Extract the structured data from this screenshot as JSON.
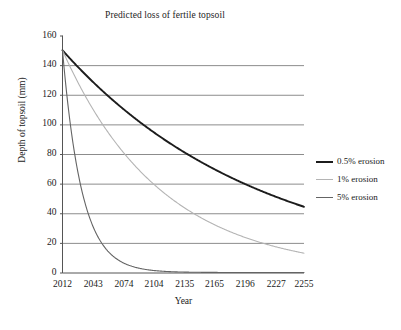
{
  "chart_data": {
    "type": "line",
    "title": "Predicted loss of fertile topsoil",
    "xlabel": "Year",
    "ylabel": "Depth of topsoil (mm)",
    "xlim": [
      2012,
      2255
    ],
    "ylim": [
      0,
      160
    ],
    "grid": true,
    "grid_axis": "y",
    "legend_position": "right",
    "xticks": [
      "2012",
      "2043",
      "2074",
      "2104",
      "2135",
      "2165",
      "2196",
      "2227",
      "2255"
    ],
    "xtick_values": [
      2012,
      2043,
      2074,
      2104,
      2135,
      2165,
      2196,
      2227,
      2255
    ],
    "yticks": [
      "0",
      "20",
      "40",
      "60",
      "80",
      "100",
      "120",
      "140",
      "160"
    ],
    "ytick_values": [
      0,
      20,
      40,
      60,
      80,
      100,
      120,
      140,
      160
    ],
    "initial_depth": 150,
    "x": [
      2012,
      2043,
      2074,
      2104,
      2135,
      2165,
      2196,
      2227,
      2255
    ],
    "series": [
      {
        "name": "0.5% erosion",
        "color": "#1c1c1c",
        "width": 1.9,
        "rate_percent": 0.5,
        "values": [
          150,
          128,
          110,
          95,
          81,
          70,
          60,
          51,
          45
        ]
      },
      {
        "name": "1% erosion",
        "color": "#b4b4b4",
        "width": 1.1,
        "rate_percent": 1,
        "values": [
          150,
          110,
          81,
          60,
          44,
          33,
          24,
          18,
          14
        ]
      },
      {
        "name": "5% erosion",
        "color": "#646464",
        "width": 1.1,
        "rate_percent": 5,
        "values": [
          150,
          32,
          6.7,
          1.5,
          0.3,
          0.07,
          0.015,
          0.003,
          0.001
        ]
      }
    ]
  },
  "legend": {
    "entries": [
      {
        "label": "0.5% erosion"
      },
      {
        "label": "1% erosion"
      },
      {
        "label": "5% erosion"
      }
    ]
  }
}
